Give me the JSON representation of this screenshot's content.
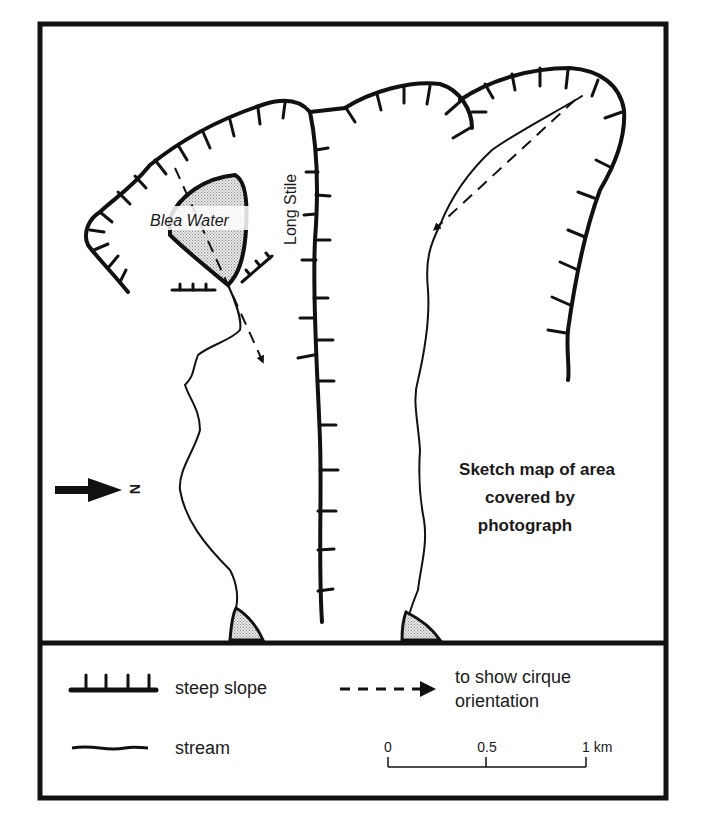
{
  "map": {
    "title_lines": [
      "Sketch map of area",
      "covered by",
      "photograph"
    ],
    "labels": {
      "lake": "Blea Water",
      "ridge": "Long Stile",
      "north": "N"
    }
  },
  "legend": {
    "steep_slope": "steep slope",
    "stream": "stream",
    "cirque_lines": [
      "to show cirque",
      "orientation"
    ],
    "scale": {
      "ticks": [
        "0",
        "0.5",
        "1 km"
      ]
    }
  },
  "colors": {
    "ink": "#111111",
    "stipple": "#c8c8c8",
    "paper": "#ffffff"
  }
}
